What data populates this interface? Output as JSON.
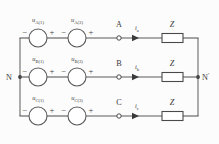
{
  "figure": {
    "background_color": "#fcfcfc",
    "line_color": "#5a5a5a"
  },
  "nodes": {
    "neutral_left": "N",
    "neutral_right": "N",
    "neutral_right_prime": "′"
  },
  "polarity": {
    "minus": "−",
    "plus": "+"
  },
  "phases": [
    {
      "name": "phase-a",
      "terminal": "A",
      "current": "i",
      "current_sub": "a",
      "impedance": "Z",
      "sources": [
        {
          "symbol": "u",
          "sub": "A(1)"
        },
        {
          "symbol": "u",
          "sub": "A(3)"
        }
      ]
    },
    {
      "name": "phase-b",
      "terminal": "B",
      "current": "i",
      "current_sub": "b",
      "impedance": "Z",
      "sources": [
        {
          "symbol": "u",
          "sub": "B(1)"
        },
        {
          "symbol": "u",
          "sub": "B(3)"
        }
      ]
    },
    {
      "name": "phase-c",
      "terminal": "C",
      "current": "i",
      "current_sub": "c",
      "impedance": "Z",
      "sources": [
        {
          "symbol": "u",
          "sub": "C(1)"
        },
        {
          "symbol": "u",
          "sub": "C(3)"
        }
      ]
    }
  ]
}
